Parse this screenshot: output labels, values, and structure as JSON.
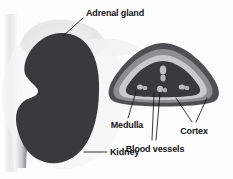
{
  "figure": {
    "background_color": "#fdfdfd"
  },
  "labels": {
    "adrenal_gland": "Adrenal gland",
    "kidney": "Kidney",
    "medulla": "Medulla",
    "blood_vessels": "Blood vessels",
    "cortex": "Cortex"
  },
  "colors": {
    "kidney_body": "#3a3a3c",
    "adrenal_gland": "#e9e9e9",
    "ureter_light": "#f2f2f2",
    "ureter_dark": "#4a4a4c",
    "shadow_band": "#e8e8e8",
    "cortex_outer": "#4f4f51",
    "cortex_mid": "#8e8e90",
    "cortex_inner": "#c9c9cb",
    "medulla": "#3a3a3c",
    "blood_vessel": "#c0c0c2",
    "label_text": "#141414",
    "leader_line": "#141414"
  },
  "parts": [
    {
      "name": "adrenal-gland",
      "label": "Adrenal gland",
      "region": "superior cap"
    },
    {
      "name": "kidney",
      "label": "Kidney",
      "region": "bean-shaped body"
    },
    {
      "name": "ureter",
      "label": "",
      "region": "inferior tube"
    },
    {
      "name": "cortex",
      "label": "Cortex",
      "region": "outer banded layers"
    },
    {
      "name": "medulla",
      "label": "Medulla",
      "region": "dark inner core"
    },
    {
      "name": "blood-vessels",
      "label": "Blood vessels",
      "region": "light blobs in medulla"
    }
  ]
}
